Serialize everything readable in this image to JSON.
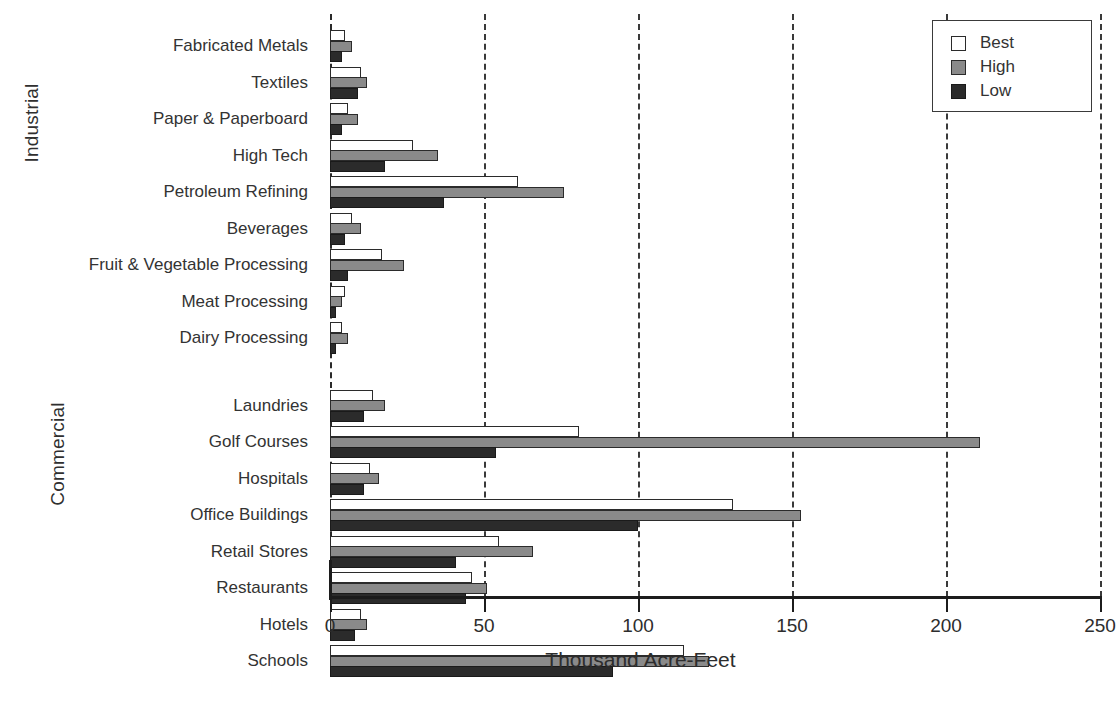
{
  "chart_data": {
    "type": "bar",
    "orientation": "horizontal",
    "title": "",
    "xlabel": "Thousand Acre-Feet",
    "ylabel": "",
    "xlim": [
      0,
      250
    ],
    "xticks": [
      0,
      50,
      100,
      150,
      200,
      250
    ],
    "xtick_labels": [
      "0",
      "50",
      "100",
      "150",
      "200",
      "250"
    ],
    "grid": "vertical-dashed",
    "legend_position": "top-right",
    "legend": [
      "Best",
      "High",
      "Low"
    ],
    "series": [
      {
        "name": "Best",
        "color": "#ffffff"
      },
      {
        "name": "High",
        "color": "#8a8a8a"
      },
      {
        "name": "Low",
        "color": "#2b2b2b"
      }
    ],
    "groups": [
      {
        "name": "Industrial",
        "categories": [
          "Fabricated Metals",
          "Textiles",
          "Paper & Paperboard",
          "High Tech",
          "Petroleum Refining",
          "Beverages",
          "Fruit & Vegetable Processing",
          "Meat Processing",
          "Dairy Processing"
        ],
        "values": {
          "Best": [
            5,
            10,
            6,
            27,
            61,
            7,
            17,
            5,
            4
          ],
          "High": [
            7,
            12,
            9,
            35,
            76,
            10,
            24,
            4,
            6
          ],
          "Low": [
            4,
            9,
            4,
            18,
            37,
            5,
            6,
            2,
            2
          ]
        }
      },
      {
        "name": "Commercial",
        "categories": [
          "Laundries",
          "Golf Courses",
          "Hospitals",
          "Office Buildings",
          "Retail Stores",
          "Restaurants",
          "Hotels",
          "Schools"
        ],
        "values": {
          "Best": [
            14,
            81,
            13,
            131,
            55,
            46,
            10,
            115
          ],
          "High": [
            18,
            211,
            16,
            153,
            66,
            51,
            12,
            123
          ],
          "Low": [
            11,
            54,
            11,
            100,
            41,
            44,
            8,
            92
          ]
        }
      }
    ]
  },
  "axis_captions": {
    "industrial": "Industrial",
    "commercial": "Commercial"
  },
  "colors": {
    "best": "#ffffff",
    "high": "#8a8a8a",
    "low": "#2b2b2b",
    "axis": "#1c1c1c",
    "grid": "#3a3a3a",
    "background": "#ffffff"
  }
}
